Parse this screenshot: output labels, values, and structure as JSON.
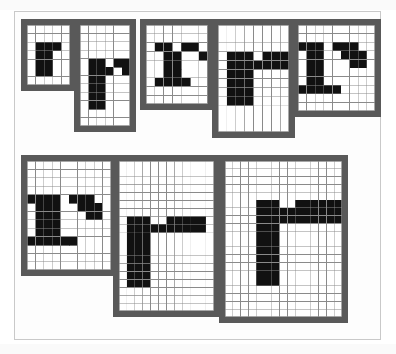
{
  "figure": {
    "caption": "",
    "background_color": "#ffffff",
    "page_border_color": "#c9c9c9",
    "frame_border_color": "#595959",
    "grid_line_color": "#8a8a8a",
    "cell_on_color": "#111111",
    "cell_off_color": "#ffffff",
    "sample_count": 8
  },
  "samples": [
    {
      "name": "r-5x7",
      "label": "r at 5 x 7",
      "cols": 5,
      "rows": 7,
      "x": 21,
      "y": 19,
      "cell": 8.6,
      "border": 6,
      "pixels": [
        "00000",
        "00000",
        "01110",
        "01100",
        "01100",
        "01100",
        "00000"
      ]
    },
    {
      "name": "r-6x12",
      "label": "r at 6 x 12",
      "cols": 6,
      "rows": 12,
      "x": 74,
      "y": 19,
      "cell": 8.4,
      "border": 6,
      "pixels": [
        "000000",
        "000000",
        "000000",
        "000000",
        "011011",
        "011101",
        "011000",
        "011000",
        "011000",
        "011000",
        "000000",
        "000000"
      ]
    },
    {
      "name": "r-7x9",
      "label": "r at 7 x 9",
      "cols": 7,
      "rows": 9,
      "x": 140,
      "y": 19,
      "cell": 8.8,
      "border": 6,
      "pixels": [
        "0000000",
        "0000000",
        "0110110",
        "0011001",
        "0011000",
        "0011000",
        "0111100",
        "0000000",
        "0000000"
      ]
    },
    {
      "name": "r-8x12",
      "label": "r at 8 x 12",
      "cols": 8,
      "rows": 12,
      "x": 212,
      "y": 19,
      "cell": 8.9,
      "border": 6,
      "pixels": [
        "00000000",
        "00000000",
        "00000000",
        "01110111",
        "01111111",
        "01110000",
        "01110000",
        "01110000",
        "01110000",
        "00000000",
        "00000000",
        "00000000"
      ]
    },
    {
      "name": "r-9x10",
      "label": "r at 9 x 10",
      "cols": 9,
      "rows": 10,
      "x": 292,
      "y": 19,
      "cell": 8.6,
      "border": 6,
      "pixels": [
        "000000000",
        "000000000",
        "111011100",
        "011001110",
        "011000110",
        "011000000",
        "011000000",
        "111110000",
        "000000000",
        "000000000"
      ]
    },
    {
      "name": "r-10x13",
      "label": "r at 10 x 13",
      "cols": 10,
      "rows": 13,
      "x": 21,
      "y": 155,
      "cell": 8.4,
      "border": 6,
      "pixels": [
        "0000000000",
        "0000000000",
        "0000000000",
        "0000000000",
        "1111011100",
        "0111001110",
        "0111000110",
        "0111000000",
        "0111000000",
        "1111110000",
        "0000000000",
        "0000000000",
        "0000000000"
      ]
    },
    {
      "name": "r-12x19",
      "label": "r at 12 x 19",
      "cols": 12,
      "rows": 19,
      "x": 113,
      "y": 155,
      "cell": 7.9,
      "border": 6,
      "pixels": [
        "000000000000",
        "000000000000",
        "000000000000",
        "000000000000",
        "000000000000",
        "000000000000",
        "000000000000",
        "011100111110",
        "011111111110",
        "011100000000",
        "011100000000",
        "011100000000",
        "011100000000",
        "011100000000",
        "011100000000",
        "011100000000",
        "000000000000",
        "000000000000",
        "000000000000"
      ]
    },
    {
      "name": "r-15x20",
      "label": "r at 15 x 20",
      "cols": 15,
      "rows": 20,
      "x": 219,
      "y": 155,
      "cell": 7.8,
      "border": 6,
      "pixels": [
        "000000000000000",
        "000000000000000",
        "000000000000000",
        "000000000000000",
        "000000000000000",
        "000011100111111",
        "000011111111111",
        "000011111111111",
        "000011100000000",
        "000011100000000",
        "000011100000000",
        "000011100000000",
        "000011100000000",
        "000011100000000",
        "000011100000000",
        "000011100000000",
        "000000000000000",
        "000000000000000",
        "000000000000000",
        "000000000000000"
      ]
    }
  ]
}
